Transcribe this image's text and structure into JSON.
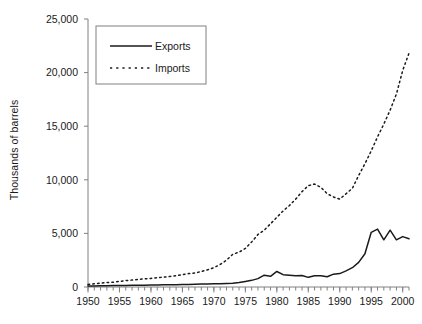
{
  "chart_data": {
    "type": "line",
    "title": "",
    "xlabel": "",
    "ylabel": "Thousands of barrels",
    "xlim": [
      1950,
      2001
    ],
    "ylim": [
      0,
      25000
    ],
    "yticks": [
      0,
      5000,
      10000,
      15000,
      20000,
      25000
    ],
    "ytick_labels": [
      "0",
      "5,000",
      "10,000",
      "15,000",
      "20,000",
      "25,000"
    ],
    "xticks": [
      1950,
      1955,
      1960,
      1965,
      1970,
      1975,
      1980,
      1985,
      1990,
      1995,
      2000
    ],
    "xtick_labels": [
      "1950",
      "1955",
      "1960",
      "1965",
      "1970",
      "1975",
      "1980",
      "1985",
      "1990",
      "1995",
      "2000"
    ],
    "x_minor_tick_interval": 1,
    "grid": false,
    "legend_position": "top-left-inside",
    "x": [
      1950,
      1951,
      1952,
      1953,
      1954,
      1955,
      1956,
      1957,
      1958,
      1959,
      1960,
      1961,
      1962,
      1963,
      1964,
      1965,
      1966,
      1967,
      1968,
      1969,
      1970,
      1971,
      1972,
      1973,
      1974,
      1975,
      1976,
      1977,
      1978,
      1979,
      1980,
      1981,
      1982,
      1983,
      1984,
      1985,
      1986,
      1987,
      1988,
      1989,
      1990,
      1991,
      1992,
      1993,
      1994,
      1995,
      1996,
      1997,
      1998,
      1999,
      2000,
      2001
    ],
    "series": [
      {
        "name": "Exports",
        "line_style": "solid",
        "color": "#1a1a1a",
        "values": [
          90,
          100,
          110,
          120,
          130,
          140,
          150,
          160,
          160,
          170,
          180,
          190,
          200,
          210,
          220,
          230,
          240,
          260,
          280,
          290,
          300,
          310,
          330,
          350,
          420,
          520,
          620,
          780,
          1100,
          1000,
          1450,
          1150,
          1100,
          1050,
          1080,
          900,
          1050,
          1060,
          960,
          1200,
          1250,
          1500,
          1800,
          2300,
          3100,
          5100,
          5400,
          4400,
          5300,
          4400,
          4700,
          4500
        ]
      },
      {
        "name": "Imports",
        "line_style": "dotted",
        "color": "#1a1a1a",
        "values": [
          230,
          300,
          350,
          420,
          450,
          520,
          600,
          650,
          700,
          760,
          800,
          860,
          920,
          980,
          1050,
          1150,
          1250,
          1300,
          1450,
          1600,
          1800,
          2100,
          2500,
          3050,
          3250,
          3600,
          4200,
          4900,
          5300,
          5900,
          6500,
          7100,
          7600,
          8200,
          8900,
          9450,
          9600,
          9300,
          8700,
          8400,
          8200,
          8700,
          9200,
          10400,
          11500,
          12700,
          14000,
          15200,
          16500,
          18000,
          20200,
          21800
        ]
      }
    ]
  },
  "legend": {
    "entries": [
      {
        "label": "Exports",
        "style": "solid"
      },
      {
        "label": "Imports",
        "style": "dotted"
      }
    ]
  }
}
